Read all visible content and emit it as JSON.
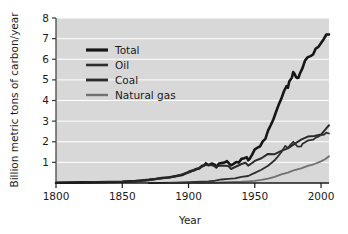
{
  "chart_data": {
    "type": "line",
    "title": "",
    "xlabel": "Year",
    "ylabel": "Billion metric tons of carbon/year",
    "xlim": [
      1800,
      2006
    ],
    "ylim": [
      0,
      8
    ],
    "xticks": [
      1800,
      1850,
      1900,
      1950,
      2000
    ],
    "yticks": [
      1,
      2,
      3,
      4,
      5,
      6,
      7,
      8
    ],
    "xtick_labels": [
      "1800",
      "1850",
      "1900",
      "1950",
      "2000"
    ],
    "ytick_labels": [
      "1",
      "2",
      "3",
      "4",
      "5",
      "6",
      "7",
      "8"
    ],
    "grid": true,
    "grid_color": "#ffffff",
    "plot_background": "#d8d8d8",
    "legend_position": "upper-left",
    "legend_entries": [
      "Total",
      "Oil",
      "Coal",
      "Natural gas"
    ],
    "series": [
      {
        "name": "Total",
        "color": "#161616",
        "width": 2.6,
        "x": [
          1800,
          1810,
          1820,
          1830,
          1840,
          1850,
          1855,
          1860,
          1865,
          1870,
          1875,
          1880,
          1885,
          1890,
          1895,
          1900,
          1902,
          1904,
          1906,
          1908,
          1910,
          1912,
          1913,
          1915,
          1917,
          1918,
          1920,
          1921,
          1923,
          1925,
          1927,
          1929,
          1930,
          1932,
          1934,
          1936,
          1938,
          1940,
          1942,
          1944,
          1945,
          1946,
          1948,
          1950,
          1952,
          1954,
          1956,
          1958,
          1960,
          1962,
          1964,
          1966,
          1968,
          1970,
          1972,
          1974,
          1975,
          1976,
          1978,
          1979,
          1980,
          1981,
          1982,
          1983,
          1984,
          1986,
          1988,
          1990,
          1992,
          1994,
          1996,
          1998,
          2000,
          2002,
          2004,
          2006
        ],
        "y": [
          0.01,
          0.02,
          0.03,
          0.04,
          0.05,
          0.06,
          0.08,
          0.09,
          0.12,
          0.15,
          0.19,
          0.24,
          0.27,
          0.33,
          0.39,
          0.53,
          0.58,
          0.62,
          0.68,
          0.7,
          0.82,
          0.86,
          0.95,
          0.86,
          0.93,
          0.94,
          0.88,
          0.76,
          0.95,
          0.97,
          0.99,
          1.06,
          0.99,
          0.85,
          0.93,
          1.02,
          0.99,
          1.17,
          1.2,
          1.25,
          1.1,
          1.16,
          1.38,
          1.63,
          1.71,
          1.78,
          2.02,
          2.14,
          2.54,
          2.8,
          3.08,
          3.44,
          3.79,
          4.08,
          4.45,
          4.7,
          4.62,
          4.92,
          5.11,
          5.38,
          5.3,
          5.15,
          5.09,
          5.1,
          5.3,
          5.57,
          5.95,
          6.1,
          6.15,
          6.23,
          6.52,
          6.6,
          6.79,
          6.97,
          7.2,
          7.2
        ]
      },
      {
        "name": "Coal",
        "color": "#2a2a2a",
        "width": 2.0,
        "x": [
          1800,
          1820,
          1840,
          1850,
          1860,
          1870,
          1880,
          1890,
          1900,
          1910,
          1913,
          1918,
          1920,
          1925,
          1930,
          1932,
          1936,
          1940,
          1943,
          1945,
          1948,
          1950,
          1955,
          1960,
          1965,
          1970,
          1975,
          1980,
          1985,
          1990,
          1995,
          2000,
          2003,
          2006
        ],
        "y": [
          0.01,
          0.03,
          0.05,
          0.06,
          0.09,
          0.15,
          0.23,
          0.32,
          0.51,
          0.78,
          0.89,
          0.86,
          0.8,
          0.85,
          0.83,
          0.68,
          0.8,
          0.92,
          0.98,
          0.84,
          0.97,
          1.07,
          1.2,
          1.41,
          1.4,
          1.56,
          1.68,
          1.9,
          2.1,
          2.25,
          2.28,
          2.35,
          2.58,
          2.8
        ]
      },
      {
        "name": "Oil",
        "color": "#2e2e2e",
        "width": 1.8,
        "x": [
          1870,
          1880,
          1890,
          1900,
          1910,
          1915,
          1920,
          1925,
          1930,
          1935,
          1940,
          1945,
          1950,
          1955,
          1960,
          1965,
          1970,
          1973,
          1975,
          1977,
          1979,
          1980,
          1982,
          1983,
          1985,
          1986,
          1988,
          1990,
          1992,
          1994,
          1996,
          1998,
          2000,
          2002,
          2004,
          2006
        ],
        "y": [
          0.0,
          0.01,
          0.02,
          0.04,
          0.07,
          0.08,
          0.11,
          0.17,
          0.2,
          0.22,
          0.3,
          0.34,
          0.49,
          0.64,
          0.84,
          1.1,
          1.49,
          1.8,
          1.7,
          1.86,
          2.0,
          1.93,
          1.78,
          1.76,
          1.78,
          1.9,
          1.98,
          2.06,
          2.08,
          2.1,
          2.2,
          2.25,
          2.33,
          2.34,
          2.44,
          2.4
        ]
      },
      {
        "name": "Natural gas",
        "color": "#707070",
        "width": 1.8,
        "x": [
          1885,
          1900,
          1910,
          1920,
          1930,
          1940,
          1945,
          1950,
          1955,
          1960,
          1965,
          1970,
          1975,
          1980,
          1985,
          1990,
          1995,
          2000,
          2003,
          2006
        ],
        "y": [
          0.0,
          0.01,
          0.01,
          0.02,
          0.04,
          0.06,
          0.08,
          0.1,
          0.15,
          0.21,
          0.3,
          0.42,
          0.5,
          0.63,
          0.71,
          0.83,
          0.92,
          1.05,
          1.15,
          1.3
        ]
      }
    ]
  },
  "legend": {
    "items": [
      {
        "label": "Total",
        "color": "#161616",
        "width": 3.2
      },
      {
        "label": "Oil",
        "color": "#2e2e2e",
        "width": 2.6
      },
      {
        "label": "Coal",
        "color": "#2a2a2a",
        "width": 2.8
      },
      {
        "label": "Natural gas",
        "color": "#707070",
        "width": 2.4
      }
    ]
  },
  "axes": {
    "x_title": "Year",
    "y_title": "Billion metric tons of carbon/year"
  }
}
